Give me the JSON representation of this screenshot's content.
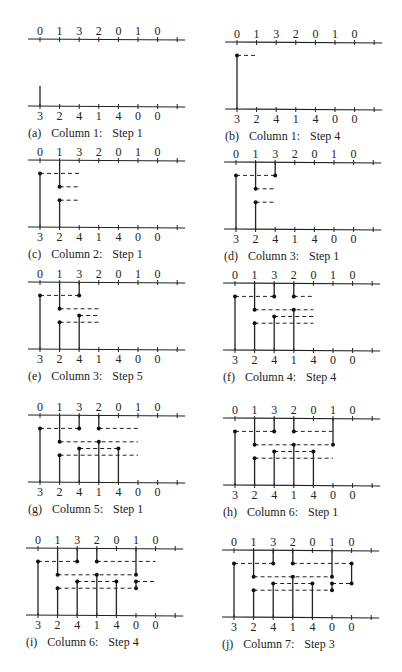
{
  "figure": {
    "top_sequence": [
      "0",
      "1",
      "3",
      "2",
      "0",
      "1",
      "0"
    ],
    "bottom_sequence": [
      "3",
      "2",
      "4",
      "1",
      "4",
      "0",
      "0"
    ],
    "panels": [
      {
        "id": "a",
        "tag": "(a)",
        "column_label": "Column 1:",
        "step_label": "Step 1",
        "solid": [
          {
            "col": 0,
            "from": 4,
            "to": 3.5
          }
        ],
        "dots": [],
        "dashes": []
      },
      {
        "id": "b",
        "tag": "(b)",
        "column_label": "Column 1:",
        "step_label": "Step 4",
        "solid": [
          {
            "col": 0,
            "from": 4,
            "to": 1
          }
        ],
        "dots": [
          {
            "col": 0,
            "row": 1
          }
        ],
        "dashes": [
          {
            "row": 1,
            "from": 0,
            "to": 1
          }
        ]
      },
      {
        "id": "c",
        "tag": "(c)",
        "column_label": "Column 2:",
        "step_label": "Step 1",
        "solid": [
          {
            "col": 0,
            "from": 4,
            "to": 1
          },
          {
            "col": 1,
            "from": 0,
            "to": 2
          },
          {
            "col": 1,
            "from": 4,
            "to": 3
          }
        ],
        "dots": [
          {
            "col": 0,
            "row": 1
          },
          {
            "col": 1,
            "row": 2
          },
          {
            "col": 1,
            "row": 3
          }
        ],
        "dashes": [
          {
            "row": 1,
            "from": 0,
            "to": 2
          },
          {
            "row": 2,
            "from": 1,
            "to": 2
          },
          {
            "row": 3,
            "from": 1,
            "to": 2
          }
        ]
      },
      {
        "id": "d",
        "tag": "(d)",
        "column_label": "Column 3:",
        "step_label": "Step 1",
        "solid": [
          {
            "col": 0,
            "from": 4,
            "to": 1
          },
          {
            "col": 1,
            "from": 0,
            "to": 2
          },
          {
            "col": 1,
            "from": 4,
            "to": 3
          },
          {
            "col": 2,
            "from": 0,
            "to": 1
          }
        ],
        "dots": [
          {
            "col": 0,
            "row": 1
          },
          {
            "col": 1,
            "row": 2
          },
          {
            "col": 1,
            "row": 3
          },
          {
            "col": 2,
            "row": 1
          }
        ],
        "dashes": [
          {
            "row": 1,
            "from": 0,
            "to": 2
          },
          {
            "row": 2,
            "from": 1,
            "to": 2
          },
          {
            "row": 3,
            "from": 1,
            "to": 2
          }
        ]
      },
      {
        "id": "e",
        "tag": "(e)",
        "column_label": "Column 3:",
        "step_label": "Step 5",
        "solid": [
          {
            "col": 0,
            "from": 4,
            "to": 1
          },
          {
            "col": 1,
            "from": 0,
            "to": 2
          },
          {
            "col": 1,
            "from": 4,
            "to": 3
          },
          {
            "col": 2,
            "from": 0,
            "to": 1
          },
          {
            "col": 2,
            "from": 4,
            "to": 2.5
          }
        ],
        "dots": [
          {
            "col": 0,
            "row": 1
          },
          {
            "col": 1,
            "row": 2
          },
          {
            "col": 1,
            "row": 3
          },
          {
            "col": 2,
            "row": 1
          },
          {
            "col": 2,
            "row": 2.5
          }
        ],
        "dashes": [
          {
            "row": 1,
            "from": 0,
            "to": 2
          },
          {
            "row": 2,
            "from": 1,
            "to": 3
          },
          {
            "row": 2.5,
            "from": 2,
            "to": 3
          },
          {
            "row": 3,
            "from": 1,
            "to": 3
          }
        ]
      },
      {
        "id": "f",
        "tag": "(f)",
        "column_label": "Column 4:",
        "step_label": "Step 4",
        "solid": [
          {
            "col": 0,
            "from": 4,
            "to": 1
          },
          {
            "col": 1,
            "from": 0,
            "to": 2
          },
          {
            "col": 1,
            "from": 4,
            "to": 3
          },
          {
            "col": 2,
            "from": 0,
            "to": 1
          },
          {
            "col": 2,
            "from": 4,
            "to": 2.5
          },
          {
            "col": 3,
            "from": 0,
            "to": 1
          },
          {
            "col": 3,
            "from": 4,
            "to": 2
          }
        ],
        "dots": [
          {
            "col": 0,
            "row": 1
          },
          {
            "col": 1,
            "row": 2
          },
          {
            "col": 1,
            "row": 3
          },
          {
            "col": 2,
            "row": 1
          },
          {
            "col": 2,
            "row": 2.5
          },
          {
            "col": 3,
            "row": 1
          },
          {
            "col": 3,
            "row": 2
          }
        ],
        "dashes": [
          {
            "row": 1,
            "from": 0,
            "to": 2
          },
          {
            "row": 1,
            "from": 3,
            "to": 4
          },
          {
            "row": 2,
            "from": 1,
            "to": 4
          },
          {
            "row": 2.5,
            "from": 2,
            "to": 4
          },
          {
            "row": 3,
            "from": 1,
            "to": 4
          }
        ]
      },
      {
        "id": "g",
        "tag": "(g)",
        "column_label": "Column 5:",
        "step_label": "Step 1",
        "solid": [
          {
            "col": 0,
            "from": 4,
            "to": 1
          },
          {
            "col": 1,
            "from": 0,
            "to": 2
          },
          {
            "col": 1,
            "from": 4,
            "to": 3
          },
          {
            "col": 2,
            "from": 0,
            "to": 1
          },
          {
            "col": 2,
            "from": 4,
            "to": 2.5
          },
          {
            "col": 3,
            "from": 0,
            "to": 1
          },
          {
            "col": 3,
            "from": 4,
            "to": 2
          },
          {
            "col": 4,
            "from": 4,
            "to": 2.5
          }
        ],
        "dots": [
          {
            "col": 0,
            "row": 1
          },
          {
            "col": 1,
            "row": 2
          },
          {
            "col": 1,
            "row": 3
          },
          {
            "col": 2,
            "row": 1
          },
          {
            "col": 2,
            "row": 2.5
          },
          {
            "col": 3,
            "row": 1
          },
          {
            "col": 3,
            "row": 2
          },
          {
            "col": 4,
            "row": 2.5
          }
        ],
        "dashes": [
          {
            "row": 1,
            "from": 0,
            "to": 2
          },
          {
            "row": 1,
            "from": 3,
            "to": 5
          },
          {
            "row": 2,
            "from": 1,
            "to": 5
          },
          {
            "row": 2.5,
            "from": 2,
            "to": 4
          },
          {
            "row": 3,
            "from": 1,
            "to": 5
          }
        ]
      },
      {
        "id": "h",
        "tag": "(h)",
        "column_label": "Column 6:",
        "step_label": "Step 1",
        "solid": [
          {
            "col": 0,
            "from": 4,
            "to": 1
          },
          {
            "col": 1,
            "from": 0,
            "to": 2
          },
          {
            "col": 1,
            "from": 4,
            "to": 3
          },
          {
            "col": 2,
            "from": 0,
            "to": 1
          },
          {
            "col": 2,
            "from": 4,
            "to": 2.5
          },
          {
            "col": 3,
            "from": 0,
            "to": 1
          },
          {
            "col": 3,
            "from": 4,
            "to": 2
          },
          {
            "col": 4,
            "from": 4,
            "to": 2.5
          },
          {
            "col": 5,
            "from": 0,
            "to": 2
          }
        ],
        "dots": [
          {
            "col": 0,
            "row": 1
          },
          {
            "col": 1,
            "row": 2
          },
          {
            "col": 1,
            "row": 3
          },
          {
            "col": 2,
            "row": 1
          },
          {
            "col": 2,
            "row": 2.5
          },
          {
            "col": 3,
            "row": 1
          },
          {
            "col": 3,
            "row": 2
          },
          {
            "col": 4,
            "row": 2.5
          },
          {
            "col": 5,
            "row": 2
          }
        ],
        "dashes": [
          {
            "row": 1,
            "from": 0,
            "to": 2
          },
          {
            "row": 1,
            "from": 3,
            "to": 5
          },
          {
            "row": 2,
            "from": 1,
            "to": 5
          },
          {
            "row": 2.5,
            "from": 2,
            "to": 4
          },
          {
            "row": 3,
            "from": 1,
            "to": 5
          }
        ]
      },
      {
        "id": "i",
        "tag": "(i)",
        "column_label": "Column 6:",
        "step_label": "Step 4",
        "solid": [
          {
            "col": 0,
            "from": 4,
            "to": 1
          },
          {
            "col": 1,
            "from": 0,
            "to": 2
          },
          {
            "col": 1,
            "from": 4,
            "to": 3
          },
          {
            "col": 2,
            "from": 0,
            "to": 1
          },
          {
            "col": 2,
            "from": 4,
            "to": 2.5
          },
          {
            "col": 3,
            "from": 0,
            "to": 1
          },
          {
            "col": 3,
            "from": 4,
            "to": 2
          },
          {
            "col": 4,
            "from": 4,
            "to": 2.5
          },
          {
            "col": 5,
            "from": 0,
            "to": 2
          },
          {
            "col": 5,
            "from": 3,
            "to": 2.5
          }
        ],
        "dots": [
          {
            "col": 0,
            "row": 1
          },
          {
            "col": 1,
            "row": 2
          },
          {
            "col": 1,
            "row": 3
          },
          {
            "col": 2,
            "row": 1
          },
          {
            "col": 2,
            "row": 2.5
          },
          {
            "col": 3,
            "row": 1
          },
          {
            "col": 3,
            "row": 2
          },
          {
            "col": 4,
            "row": 2.5
          },
          {
            "col": 5,
            "row": 2
          },
          {
            "col": 5,
            "row": 2.5
          },
          {
            "col": 5,
            "row": 3
          }
        ],
        "dashes": [
          {
            "row": 1,
            "from": 0,
            "to": 2
          },
          {
            "row": 1,
            "from": 3,
            "to": 6
          },
          {
            "row": 2,
            "from": 1,
            "to": 5
          },
          {
            "row": 2.5,
            "from": 2,
            "to": 4
          },
          {
            "row": 2.5,
            "from": 5,
            "to": 6
          },
          {
            "row": 3,
            "from": 1,
            "to": 5
          }
        ]
      },
      {
        "id": "j",
        "tag": "(j)",
        "column_label": "Column 7:",
        "step_label": "Step 3",
        "solid": [
          {
            "col": 0,
            "from": 4,
            "to": 1
          },
          {
            "col": 1,
            "from": 0,
            "to": 2
          },
          {
            "col": 1,
            "from": 4,
            "to": 3
          },
          {
            "col": 2,
            "from": 0,
            "to": 1
          },
          {
            "col": 2,
            "from": 4,
            "to": 2.5
          },
          {
            "col": 3,
            "from": 0,
            "to": 1
          },
          {
            "col": 3,
            "from": 4,
            "to": 2
          },
          {
            "col": 4,
            "from": 4,
            "to": 2.5
          },
          {
            "col": 5,
            "from": 0,
            "to": 2
          },
          {
            "col": 5,
            "from": 3,
            "to": 2.5
          },
          {
            "col": 6,
            "from": 1,
            "to": 2.5
          }
        ],
        "dots": [
          {
            "col": 0,
            "row": 1
          },
          {
            "col": 1,
            "row": 2
          },
          {
            "col": 1,
            "row": 3
          },
          {
            "col": 2,
            "row": 1
          },
          {
            "col": 2,
            "row": 2.5
          },
          {
            "col": 3,
            "row": 1
          },
          {
            "col": 3,
            "row": 2
          },
          {
            "col": 4,
            "row": 2.5
          },
          {
            "col": 5,
            "row": 2
          },
          {
            "col": 5,
            "row": 2.5
          },
          {
            "col": 5,
            "row": 3
          },
          {
            "col": 6,
            "row": 1
          },
          {
            "col": 6,
            "row": 2.5
          }
        ],
        "dashes": [
          {
            "row": 1,
            "from": 0,
            "to": 2
          },
          {
            "row": 1,
            "from": 3,
            "to": 6
          },
          {
            "row": 2,
            "from": 1,
            "to": 5
          },
          {
            "row": 2.5,
            "from": 2,
            "to": 4
          },
          {
            "row": 2.5,
            "from": 5,
            "to": 6
          },
          {
            "row": 3,
            "from": 1,
            "to": 5
          }
        ]
      }
    ]
  }
}
